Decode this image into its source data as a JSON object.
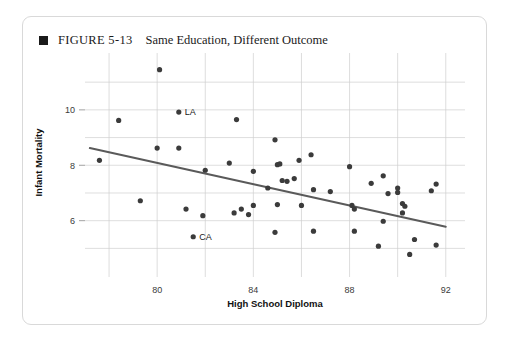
{
  "figure": {
    "bullet_icon": "square-bullet-icon",
    "label": "FIGURE 5-13",
    "title": "Same Education, Different Outcome"
  },
  "chart_data": {
    "type": "scatter",
    "title": "Same Education, Different Outcome",
    "xlabel": "High School Diploma",
    "ylabel": "Infant Mortality",
    "xlim": [
      77,
      92.8
    ],
    "ylim": [
      4.4,
      11.8
    ],
    "xticks": [
      80,
      84,
      88,
      92
    ],
    "xticks_minor": [
      78,
      82,
      86,
      90
    ],
    "yticks": [
      6,
      8,
      10
    ],
    "ygridlines": [
      5,
      6,
      7,
      8,
      9,
      10,
      11
    ],
    "grid": true,
    "legend": "none",
    "marker_color": "#3b3b3b",
    "trendline": {
      "color": "#5a5a5a",
      "x": [
        77.2,
        92.0
      ],
      "y": [
        8.62,
        5.78
      ]
    },
    "annotations": [
      {
        "label": "LA",
        "x": 80.9,
        "y": 9.92
      },
      {
        "label": "CA",
        "x": 81.5,
        "y": 5.42
      }
    ],
    "points": [
      {
        "x": 80.1,
        "y": 11.45
      },
      {
        "x": 78.4,
        "y": 9.62
      },
      {
        "x": 80.9,
        "y": 9.92,
        "label": "LA"
      },
      {
        "x": 83.3,
        "y": 9.65
      },
      {
        "x": 79.3,
        "y": 6.72
      },
      {
        "x": 80.0,
        "y": 8.62
      },
      {
        "x": 80.9,
        "y": 8.62
      },
      {
        "x": 77.6,
        "y": 8.18
      },
      {
        "x": 82.0,
        "y": 7.82
      },
      {
        "x": 81.2,
        "y": 6.42
      },
      {
        "x": 81.9,
        "y": 6.18
      },
      {
        "x": 83.2,
        "y": 6.28
      },
      {
        "x": 83.8,
        "y": 6.22
      },
      {
        "x": 81.5,
        "y": 5.42,
        "label": "CA"
      },
      {
        "x": 83.0,
        "y": 8.08
      },
      {
        "x": 84.9,
        "y": 8.92
      },
      {
        "x": 85.9,
        "y": 8.18
      },
      {
        "x": 85.0,
        "y": 8.02
      },
      {
        "x": 85.1,
        "y": 8.05
      },
      {
        "x": 86.4,
        "y": 8.38
      },
      {
        "x": 84.0,
        "y": 7.78
      },
      {
        "x": 85.7,
        "y": 7.52
      },
      {
        "x": 85.2,
        "y": 7.45
      },
      {
        "x": 85.4,
        "y": 7.42
      },
      {
        "x": 84.6,
        "y": 7.18
      },
      {
        "x": 86.5,
        "y": 7.12
      },
      {
        "x": 87.2,
        "y": 7.05
      },
      {
        "x": 84.0,
        "y": 6.55
      },
      {
        "x": 83.5,
        "y": 6.42
      },
      {
        "x": 85.0,
        "y": 6.58
      },
      {
        "x": 86.0,
        "y": 6.55
      },
      {
        "x": 84.9,
        "y": 5.58
      },
      {
        "x": 86.5,
        "y": 5.62
      },
      {
        "x": 88.0,
        "y": 7.95
      },
      {
        "x": 89.4,
        "y": 7.62
      },
      {
        "x": 88.9,
        "y": 7.35
      },
      {
        "x": 91.6,
        "y": 7.32
      },
      {
        "x": 89.6,
        "y": 6.98
      },
      {
        "x": 90.0,
        "y": 7.02
      },
      {
        "x": 90.0,
        "y": 7.18
      },
      {
        "x": 91.4,
        "y": 7.08
      },
      {
        "x": 88.1,
        "y": 6.55
      },
      {
        "x": 88.2,
        "y": 6.42
      },
      {
        "x": 90.2,
        "y": 6.62
      },
      {
        "x": 90.3,
        "y": 6.52
      },
      {
        "x": 90.2,
        "y": 6.28
      },
      {
        "x": 89.4,
        "y": 5.98
      },
      {
        "x": 88.2,
        "y": 5.62
      },
      {
        "x": 90.7,
        "y": 5.32
      },
      {
        "x": 91.6,
        "y": 5.12
      },
      {
        "x": 90.5,
        "y": 4.78
      },
      {
        "x": 89.2,
        "y": 5.08
      }
    ]
  }
}
